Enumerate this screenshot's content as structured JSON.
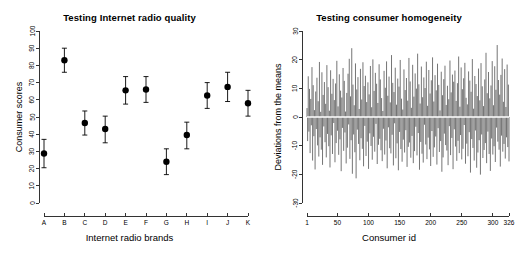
{
  "figure": {
    "background": "#ffffff",
    "foreground": "#000000",
    "panels": 2
  },
  "chart_data": [
    {
      "type": "scatter",
      "id": "internet-radio-quality",
      "title": "Testing Internet radio quality",
      "xlabel": "Internet radio brands",
      "ylabel": "Consumer scores",
      "categories": [
        "A",
        "B",
        "C",
        "D",
        "E",
        "F",
        "G",
        "H",
        "I",
        "J",
        "K"
      ],
      "values": [
        28.8,
        83.0,
        46.5,
        43.0,
        65.5,
        66.0,
        24.0,
        39.5,
        62.5,
        67.5,
        58.0
      ],
      "err_low": [
        20.5,
        76.0,
        39.5,
        35.0,
        57.5,
        58.5,
        16.5,
        31.5,
        55.0,
        59.0,
        50.5
      ],
      "err_high": [
        37.0,
        90.0,
        53.5,
        50.5,
        73.5,
        73.5,
        31.5,
        47.0,
        70.0,
        76.0,
        65.5
      ],
      "ylim": [
        0,
        100
      ],
      "yticks": [
        0,
        10,
        20,
        30,
        40,
        50,
        60,
        70,
        80,
        90,
        100
      ],
      "ytick_labels": [
        "0",
        "10",
        "20",
        "30",
        "40",
        "50",
        "60",
        "70",
        "80",
        "90",
        "100"
      ],
      "grid": false,
      "legend": "none",
      "marker": "filled-circle",
      "error_bars": true
    },
    {
      "type": "bar",
      "id": "consumer-homogeneity",
      "title": "Testing consumer homogeneity",
      "xlabel": "Consumer id",
      "ylabel": "Deviations from the means",
      "ylim": [
        -30,
        30
      ],
      "yticks": [
        -30,
        -20,
        -10,
        0,
        10,
        20,
        30
      ],
      "ytick_labels": [
        "-30",
        "-20",
        "-10",
        "0",
        "10",
        "20",
        "30"
      ],
      "xlim": [
        1,
        326
      ],
      "xticks": [
        1,
        50,
        100,
        150,
        200,
        250,
        300,
        326
      ],
      "xtick_labels": [
        "1",
        "50",
        "100",
        "150",
        "200",
        "250",
        "300",
        "326"
      ],
      "n_points": 326,
      "grid": false,
      "legend": "none",
      "style": "vertical-spikes-from-zero",
      "zero_reference_line": true,
      "zero_reference_color": "#ffffff",
      "values": [
        3.1,
        -8.4,
        14.2,
        -5.1,
        9.8,
        -12.6,
        6.3,
        -2.9,
        17.4,
        -15.2,
        11.1,
        -6.7,
        2.4,
        -18.3,
        8.9,
        -4.2,
        13.7,
        -9.9,
        5.5,
        -13.8,
        19.2,
        -7.1,
        1.8,
        -11.4,
        15.6,
        -16.7,
        7.7,
        -3.3,
        12.2,
        -8.8,
        4.6,
        -14.1,
        18.1,
        -5.9,
        10.4,
        -10.2,
        2.2,
        -17.6,
        16.3,
        -6.4,
        8.1,
        -12.9,
        13.3,
        -2.1,
        5.9,
        -15.8,
        11.7,
        -9.1,
        19.6,
        -4.8,
        3.7,
        -13.2,
        14.9,
        -7.8,
        9.2,
        -18.9,
        6.8,
        -3.8,
        17.1,
        -11.8,
        12.6,
        -5.4,
        1.9,
        -16.2,
        8.4,
        -10.7,
        15.1,
        -2.6,
        20.3,
        -14.6,
        7.2,
        -8.1,
        24.0,
        -19.8,
        11.3,
        -6.1,
        4.1,
        -12.3,
        18.7,
        -21.4,
        9.6,
        -4.4,
        13.9,
        -9.4,
        2.8,
        -15.1,
        16.8,
        -7.4,
        6.1,
        -11.1,
        19.1,
        -17.2,
        10.8,
        -3.1,
        14.4,
        -13.6,
        5.2,
        -8.6,
        12.1,
        -18.1,
        7.9,
        -5.7,
        17.8,
        -10.1,
        3.4,
        -14.9,
        20.1,
        -6.9,
        9.1,
        -12.1,
        15.4,
        -2.4,
        11.6,
        -16.4,
        4.9,
        -9.7,
        18.4,
        -7.6,
        13.1,
        -11.6,
        6.6,
        -15.4,
        2.1,
        -4.1,
        16.1,
        -13.1,
        10.2,
        -8.2,
        19.4,
        -17.9,
        7.4,
        -3.6,
        14.1,
        -10.9,
        5.1,
        -12.7,
        21.6,
        -6.2,
        11.9,
        -16.9,
        8.7,
        -2.2,
        17.2,
        -14.4,
        4.3,
        -9.2,
        13.4,
        -18.6,
        10.6,
        -5.2,
        19.9,
        -11.2,
        6.4,
        -15.6,
        2.6,
        -7.9,
        16.6,
        -12.4,
        9.4,
        -4.6,
        13.6,
        -17.4,
        5.7,
        -10.4,
        20.6,
        -8.9,
        12.4,
        -14.2,
        3.2,
        -6.6,
        18.2,
        -16.1,
        7.1,
        -11.9,
        15.2,
        -3.4,
        9.9,
        -13.4,
        22.1,
        -5.6,
        11.4,
        -18.4,
        4.7,
        -8.7,
        17.6,
        -12.8,
        6.9,
        -15.9,
        13.8,
        -2.7,
        10.1,
        -9.6,
        19.3,
        -14.7,
        3.9,
        -7.2,
        16.4,
        -11.3,
        8.2,
        -17.1,
        12.8,
        -4.9,
        20.8,
        -13.9,
        5.4,
        -10.6,
        14.6,
        -6.8,
        9.3,
        -16.6,
        18.6,
        -3.9,
        11.2,
        -12.2,
        2.3,
        -8.4,
        15.8,
        -19.1,
        7.6,
        -14.1,
        13.2,
        -5.8,
        17.9,
        -9.8,
        4.2,
        -11.7,
        10.9,
        -16.8,
        6.2,
        -3.2,
        19.7,
        -13.3,
        8.6,
        -7.3,
        14.8,
        -18.2,
        12.3,
        -4.3,
        16.2,
        -10.3,
        5.6,
        -15.3,
        11.8,
        -8.3,
        21.1,
        -12.6,
        3.6,
        -6.3,
        17.3,
        -14.8,
        9.7,
        -11.1,
        13.5,
        -2.8,
        18.9,
        -16.3,
        6.7,
        -9.3,
        4.4,
        -13.7,
        15.9,
        -5.3,
        12.7,
        -19.4,
        8.8,
        -7.7,
        20.2,
        -10.8,
        2.9,
        -15.2,
        14.3,
        -4.7,
        11.5,
        -17.7,
        7.3,
        -12.4,
        16.9,
        -8.1,
        5.8,
        -20.1,
        18.8,
        -6.1,
        10.7,
        -14.3,
        3.8,
        -11.5,
        13.1,
        -9.1,
        22.4,
        -16.1,
        8.3,
        -5.1,
        15.7,
        -12.9,
        6.5,
        -18.8,
        11.0,
        -7.5,
        19.5,
        -13.1,
        4.1,
        -10.2,
        17.7,
        -15.7,
        9.5,
        -3.7,
        25.1,
        -8.6,
        12.9,
        -11.4,
        7.8,
        -17.3,
        14.7,
        -6.5,
        20.4,
        -12.1,
        5.3,
        -9.4,
        16.7,
        -14.5,
        3.5,
        -7.1,
        18.3,
        -10.5,
        11.3,
        -15.5,
        8.5,
        -4.5,
        13.0,
        -12.3,
        17.5,
        -6.0
      ]
    }
  ]
}
